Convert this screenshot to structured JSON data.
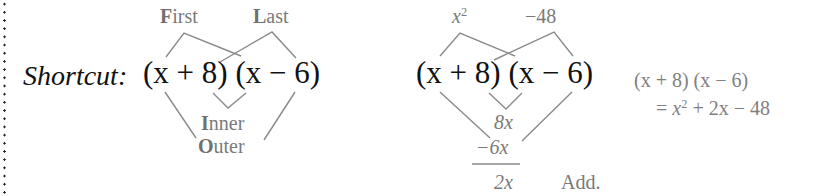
{
  "left_panel": {
    "prefix": "Shortcut:",
    "expression": "(x + 8) (x − 6)",
    "labels": {
      "first": {
        "initial": "F",
        "rest": "irst"
      },
      "last": {
        "initial": "L",
        "rest": "ast"
      },
      "inner": {
        "initial": "I",
        "rest": "nner"
      },
      "outer": {
        "initial": "O",
        "rest": "uter"
      }
    }
  },
  "middle_panel": {
    "expression": "(x + 8) (x − 6)",
    "first_product": {
      "base": "x",
      "exp": "2"
    },
    "last_product": "−48",
    "inner_product": "8x",
    "outer_product": "−6x",
    "sum": "2x",
    "sum_label": "Add."
  },
  "right_panel": {
    "line1": "(x + 8) (x − 6)",
    "line2_prefix": "= ",
    "line2_base": "x",
    "line2_exp": "2",
    "line2_rest": " + 2x − 48"
  },
  "colors": {
    "main_text": "#111111",
    "annotation_text": "#7a7a7a",
    "lines": "#8a8a8a"
  }
}
